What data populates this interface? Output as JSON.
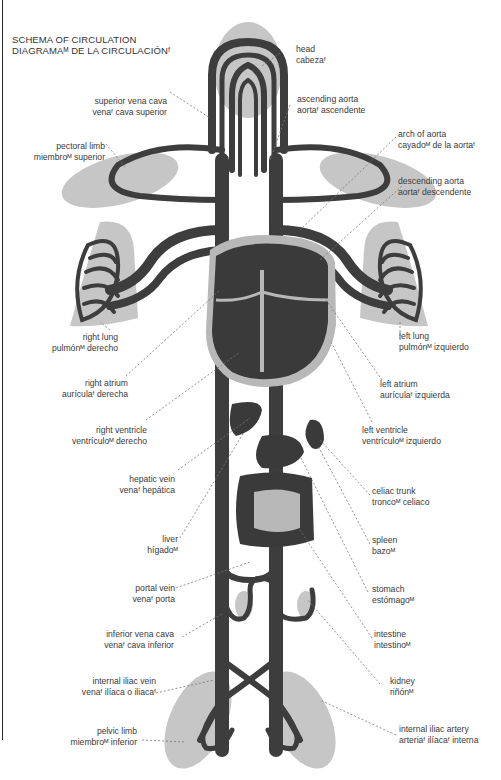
{
  "title": {
    "line1": "SCHEMA OF CIRCULATION",
    "line2": "DIAGRAMAᴹ DE LA CIRCULACIÓNᶠ"
  },
  "colors": {
    "vessel": "#3d3d3d",
    "organ_fill": "#3a3a3a",
    "region_shade": "#c4c4c4",
    "heart_wall": "#b8b8b8",
    "leader": "#6a6a6a"
  },
  "labels_left": [
    {
      "en": "superior vena cava",
      "es": "venaᶠ cava superior"
    },
    {
      "en": "pectoral limb",
      "es": "miembroᴹ superior"
    },
    {
      "en": "right lung",
      "es": "pulmónᴹ derecho"
    },
    {
      "en": "right atrium",
      "es": "aurículaᶠ derecha"
    },
    {
      "en": "right ventricle",
      "es": "ventrículoᴹ derecho"
    },
    {
      "en": "hepatic vein",
      "es": "venaᶠ hepática"
    },
    {
      "en": "liver",
      "es": "hígadoᴹ"
    },
    {
      "en": "portal vein",
      "es": "venaᶠ porta"
    },
    {
      "en": "inferior vena cava",
      "es": "venaᶠ cava inferior"
    },
    {
      "en": "internal iliac vein",
      "es": "venaᶠ ilíaca o iliacaᶠ"
    },
    {
      "en": "pelvic limb",
      "es": "miembroᴹ inferior"
    }
  ],
  "labels_right": [
    {
      "en": "head",
      "es": "cabezaᶠ"
    },
    {
      "en": "ascending aorta",
      "es": "aortaᶠ ascendente"
    },
    {
      "en": "arch of aorta",
      "es": "cayadoᴹ de la aortaᶠ"
    },
    {
      "en": "descending aorta",
      "es": "aortaᶠ descendente"
    },
    {
      "en": "left lung",
      "es": "pulmónᴹ izquierdo"
    },
    {
      "en": "left atrium",
      "es": "aurículaᶠ izquierda"
    },
    {
      "en": "left ventricle",
      "es": "ventrículoᴹ izquierdo"
    },
    {
      "en": "celiac trunk",
      "es": "troncoᴹ celiaco"
    },
    {
      "en": "spleen",
      "es": "bazoᴹ"
    },
    {
      "en": "stomach",
      "es": "estómagoᴹ"
    },
    {
      "en": "intestine",
      "es": "intestinoᴹ"
    },
    {
      "en": "kidney",
      "es": "riñónᴹ"
    },
    {
      "en": "internal iliac artery",
      "es": "arteriaᶠ ilíacaᶠ interna"
    }
  ]
}
